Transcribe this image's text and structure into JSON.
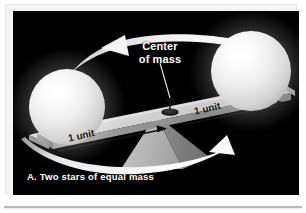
{
  "figure": {
    "caption": "A. Two stars of equal mass",
    "background_color": "#000000",
    "page_color": "#ffffff",
    "labels": {
      "center_of_mass_line1": "Center",
      "center_of_mass_line2": "of mass",
      "unit_left": "1 unit",
      "unit_right": "1 unit"
    },
    "elements": {
      "star_left": "star-left",
      "star_right": "star-right",
      "beam": "balance-beam",
      "fulcrum": "fulcrum-pyramid",
      "center_of_mass_marker": "center-of-mass-pin",
      "leader_line": "center-of-mass-leader-line",
      "rotation_arrow_top": "orbital-rotation-arrow-top",
      "rotation_arrow_bottom": "orbital-rotation-arrow-bottom",
      "measure_arrow_left": "measure-arrow-left",
      "measure_arrow_right": "measure-arrow-right"
    },
    "colors": {
      "star": "#f2f2f2",
      "beam": "#cfcfcf",
      "fulcrum": "#b4b4b4",
      "arrow": "#ffffff",
      "label_dark": "#1a1a1a",
      "label_light": "#ffffff"
    }
  }
}
